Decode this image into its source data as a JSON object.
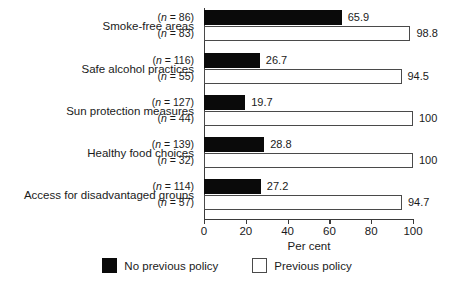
{
  "chart_data": {
    "type": "bar",
    "orientation": "horizontal",
    "title": "",
    "xlabel": "Per cent",
    "ylabel": "",
    "xlim": [
      0,
      100
    ],
    "xticks": [
      0,
      20,
      40,
      60,
      80,
      100
    ],
    "xtick_labels": [
      "0",
      "20",
      "40",
      "60",
      "80",
      "100"
    ],
    "grid": false,
    "legend_position": "bottom-center",
    "categories": [
      "Smoke-free areas",
      "Safe alcohol practices",
      "Sun protection measures",
      "Healthy food choices",
      "Access for disadvantaged groups"
    ],
    "series": [
      {
        "name": "No previous policy",
        "color": "#0a0a0a",
        "values": [
          65.9,
          26.7,
          19.7,
          28.8,
          27.2
        ],
        "value_labels": [
          "65.9",
          "26.7",
          "19.7",
          "28.8",
          "27.2"
        ],
        "n": [
          86,
          116,
          127,
          139,
          114
        ],
        "n_labels": [
          "(n = 86)",
          "(n = 116)",
          "(n = 127)",
          "(n = 139)",
          "(n = 114)"
        ]
      },
      {
        "name": "Previous policy",
        "color": "#ffffff",
        "values": [
          98.8,
          94.5,
          100,
          100,
          94.7
        ],
        "value_labels": [
          "98.8",
          "94.5",
          "100",
          "100",
          "94.7"
        ],
        "n": [
          83,
          55,
          44,
          32,
          57
        ],
        "n_labels": [
          "(n = 83)",
          "(n = 55)",
          "(n = 44)",
          "(n = 32)",
          "(n = 57)"
        ]
      }
    ]
  },
  "legend": {
    "items": [
      {
        "label": "No previous policy",
        "swatch": "dark"
      },
      {
        "label": "Previous policy",
        "swatch": "light"
      }
    ]
  },
  "axis": {
    "x_title": "Per cent"
  }
}
